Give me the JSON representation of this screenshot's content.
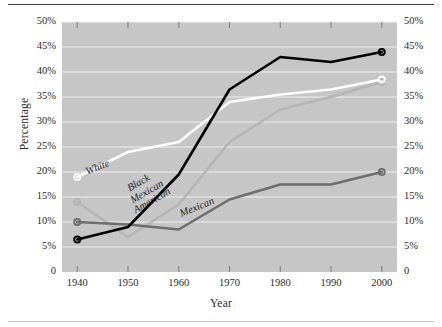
{
  "chart_data": {
    "type": "line",
    "title": "",
    "xlabel": "Year",
    "ylabel": "Percentage",
    "ylabel_right": "",
    "x": [
      1940,
      1950,
      1960,
      1970,
      1980,
      1990,
      2000
    ],
    "xlim": [
      1937,
      2003
    ],
    "ylim": [
      0,
      50
    ],
    "xticks": [
      1940,
      1950,
      1960,
      1970,
      1980,
      1990,
      2000
    ],
    "xticklabels": [
      "1940",
      "1950",
      "1960",
      "1970",
      "1980",
      "1990",
      "2000"
    ],
    "yticks": [
      0,
      5,
      10,
      15,
      20,
      25,
      30,
      35,
      40,
      45,
      50
    ],
    "yticklabels_left": [
      "0",
      "5%",
      "10%",
      "15%",
      "20%",
      "25%",
      "30%",
      "35%",
      "40%",
      "45%",
      "50%"
    ],
    "yticklabels_right": [
      "0",
      "5%",
      "10%",
      "15%",
      "20%",
      "25%",
      "30%",
      "35%",
      "40%",
      "45%",
      "50%"
    ],
    "grid": true,
    "grid_color": "#f2f2f2",
    "plot_background": "#c6c6c6",
    "legend_position": "inline-labels",
    "marker": "open-circle-end-caps",
    "series": [
      {
        "name": "White",
        "label": "White",
        "color": "#ffffff",
        "values": [
          19.0,
          24.0,
          26.0,
          34.0,
          35.5,
          36.5,
          38.5
        ]
      },
      {
        "name": "Black",
        "label": "Black",
        "color": "#000000",
        "values": [
          6.5,
          9.0,
          19.5,
          36.5,
          43.0,
          42.0,
          44.0
        ]
      },
      {
        "name": "Mexican American",
        "label": "Mexican American",
        "color": "#b5b5b5",
        "values": [
          14.0,
          7.0,
          13.5,
          26.0,
          32.5,
          35.0,
          38.0
        ]
      },
      {
        "name": "Mexican",
        "label": "Mexican",
        "color": "#6e6e6e",
        "values": [
          10.0,
          9.5,
          8.5,
          14.5,
          17.5,
          17.5,
          20.0
        ]
      }
    ],
    "series_label_positions": [
      {
        "label": "White",
        "x": 86,
        "y": 166,
        "rotate": -22
      },
      {
        "label": "Black",
        "x": 128,
        "y": 183,
        "rotate": -30
      },
      {
        "label": "Mexican",
        "x": 131,
        "y": 195,
        "rotate": -30
      },
      {
        "label": "American",
        "x": 134,
        "y": 205,
        "rotate": -30
      },
      {
        "label": "Mexican",
        "x": 180,
        "y": 208,
        "rotate": -22
      }
    ]
  }
}
